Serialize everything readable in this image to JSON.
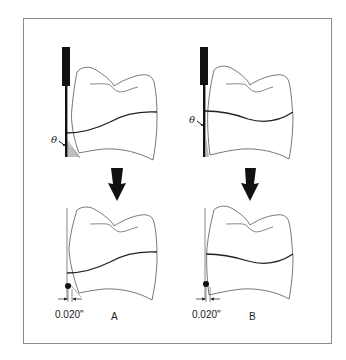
{
  "figure": {
    "type": "dental diagram",
    "colors": {
      "frame": "#8a8a8a",
      "outline": "#555555",
      "margin_line": "#222222",
      "instrument": "#111111",
      "angle_fill": "#bdbdbd",
      "arrow": "#111111"
    },
    "panels": [
      {
        "id": "A",
        "label": "A",
        "top": {
          "angle_symbol": "θ"
        },
        "bottom": {
          "dimension_label": "0.020\""
        }
      },
      {
        "id": "B",
        "label": "B",
        "top": {
          "angle_symbol": "θ"
        },
        "bottom": {
          "dimension_label": "0.020\""
        }
      }
    ]
  }
}
